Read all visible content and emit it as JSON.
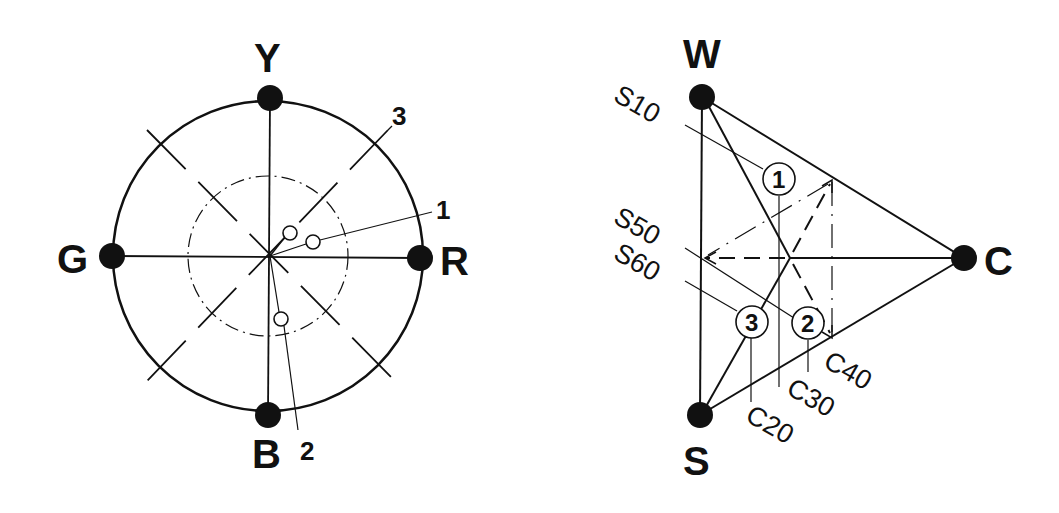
{
  "hue_circle": {
    "poles": {
      "top": "Y",
      "left": "G",
      "right": "R",
      "bottom": "B"
    },
    "point_labels": [
      "1",
      "2",
      "3"
    ]
  },
  "triangle": {
    "vertices": {
      "top": "W",
      "right": "C",
      "bottom": "S"
    },
    "blackness_labels": [
      "S10",
      "S50",
      "S60"
    ],
    "chromaticness_labels": [
      "C20",
      "C30",
      "C40"
    ],
    "samples": [
      "1",
      "2",
      "3"
    ]
  }
}
